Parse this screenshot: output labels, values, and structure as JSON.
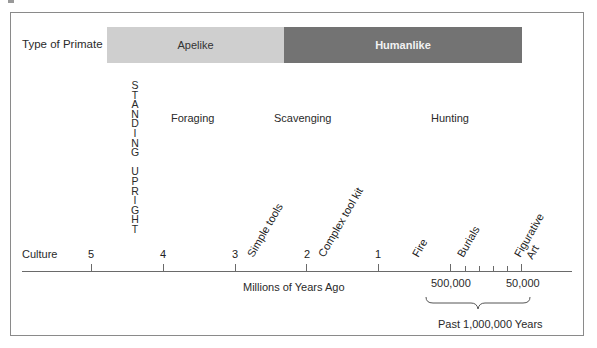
{
  "diagram": {
    "row_labels": {
      "primate": "Type of Primate",
      "culture": "Culture"
    },
    "primate_bars": [
      {
        "label": "Apelike",
        "color": "#cfcfcf"
      },
      {
        "label": "Humanlike",
        "color": "#737373"
      }
    ],
    "vertical_label": [
      "S",
      "T",
      "A",
      "N",
      "D",
      "I",
      "N",
      "G",
      " ",
      "U",
      "P",
      "R",
      "I",
      "G",
      "H",
      "T"
    ],
    "activities": {
      "foraging": "Foraging",
      "scavenging": "Scavenging",
      "hunting": "Hunting"
    },
    "axis_ticks": [
      "5",
      "4",
      "3",
      "2",
      "1"
    ],
    "milestones": {
      "simple_tools": "Simple tools",
      "complex_tool_kit": "Complex tool kit",
      "fire": "Fire",
      "burials": "Burials",
      "figurative_art_1": "Figurative",
      "figurative_art_2": "Art"
    },
    "axis_title": "Millions of Years Ago",
    "inset_ticks": {
      "left": "500,000",
      "right": "50,000"
    },
    "inset_caption": "Past 1,000,000 Years"
  }
}
